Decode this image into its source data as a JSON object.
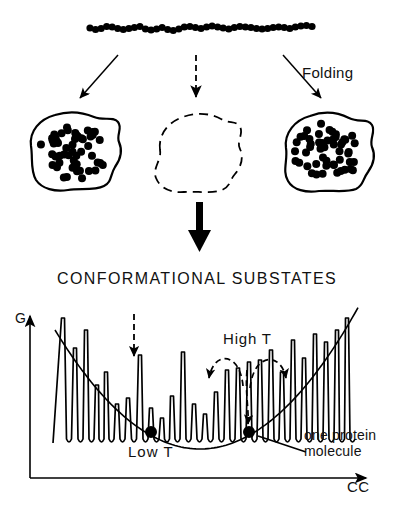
{
  "figure": {
    "background": "#ffffff",
    "ink": "#000000"
  },
  "labels": {
    "folding": "Folding",
    "substates_title": "CONFORMATIONAL  SUBSTATES",
    "g_axis": "G",
    "high_t": "High  T",
    "low_t": "Low  T",
    "one_protein_line1": "one  protein",
    "one_protein_line2": "molecule",
    "cc_axis": "CC"
  },
  "chain": {
    "description": "unfolded polypeptide chain of beads",
    "bead_count": 41,
    "bead_radius": 3.6,
    "x_start": 90,
    "x_end": 312,
    "y_center": 28,
    "wobble": [
      0,
      1.5,
      0.5,
      -1.5,
      -1,
      0.5,
      1.5,
      0.5,
      -0.5,
      -1.5,
      1,
      2,
      1,
      -0.5,
      1.5,
      2.5,
      1,
      -1,
      -1.5,
      -0.5,
      0.5,
      -1,
      -2,
      -1,
      0,
      1,
      -0.5,
      -1.5,
      -1,
      -0.5,
      0.5,
      1,
      0.5,
      -0.5,
      -1,
      -0.5,
      0.5,
      -1,
      -2,
      -2.5,
      -1.5
    ]
  },
  "arrows": {
    "left_fold": {
      "style": "solid",
      "x1": 118,
      "y1": 55,
      "x2": 78,
      "y2": 100
    },
    "center_fold": {
      "style": "dashed",
      "x1": 196,
      "y1": 55,
      "x2": 196,
      "y2": 100
    },
    "right_fold": {
      "style": "solid",
      "x1": 283,
      "y1": 55,
      "x2": 323,
      "y2": 100
    },
    "thick_down": {
      "style": "thick-solid",
      "x1": 200,
      "y1": 202,
      "x2": 200,
      "y2": 248
    },
    "substate_dashed": {
      "style": "dashed",
      "x1": 134,
      "y1": 314,
      "x2": 134,
      "y2": 358
    }
  },
  "blobs": [
    {
      "name": "folded-protein-left",
      "outline": "solid",
      "filled": true,
      "cx": 73,
      "cy": 152,
      "dot_count": 52
    },
    {
      "name": "unfolded-blob-center",
      "outline": "dashed",
      "filled": false,
      "cx": 200,
      "cy": 152,
      "dot_count": 0
    },
    {
      "name": "folded-protein-right",
      "outline": "solid",
      "filled": true,
      "cx": 327,
      "cy": 152,
      "dot_count": 52
    }
  ],
  "chart_data": {
    "type": "line",
    "title": "CONFORMATIONAL  SUBSTATES",
    "xlabel": "CC",
    "ylabel": "G",
    "grid": false,
    "legend": null,
    "axis": {
      "x_origin": 30,
      "y_origin": 478,
      "x_end": 372,
      "y_top": 312
    },
    "envelope": {
      "description": "smooth parabolic low-temperature envelope",
      "vertex_x": 200,
      "vertex_y": 449,
      "left_x": 55,
      "left_y": 330,
      "right_x": 360,
      "right_y": 330
    },
    "peaks_x": [
      63,
      75,
      86,
      97,
      106,
      117,
      128,
      140,
      151,
      162,
      172,
      183,
      194,
      205,
      216,
      227,
      238,
      249,
      260,
      271,
      282,
      293,
      304,
      315,
      326,
      337,
      347
    ],
    "peaks_y": [
      318,
      348,
      330,
      385,
      372,
      404,
      398,
      355,
      408,
      418,
      396,
      352,
      404,
      414,
      392,
      370,
      368,
      362,
      360,
      350,
      372,
      340,
      358,
      334,
      342,
      330,
      318
    ],
    "wells_y": 443,
    "molecules": [
      {
        "name": "protein-molecule-dot-left",
        "x": 151,
        "y": 432,
        "r": 6
      },
      {
        "name": "protein-molecule-dot-right",
        "x": 249,
        "y": 432,
        "r": 6
      }
    ],
    "hop_arcs": [
      {
        "name": "high-t-hop-left",
        "from_x": 245,
        "to_x": 208,
        "apex_y": 356,
        "base_y": 392
      },
      {
        "name": "high-t-hop-right",
        "from_x": 252,
        "to_x": 288,
        "apex_y": 356,
        "base_y": 392
      }
    ],
    "leader_line": {
      "x1": 262,
      "y1": 436,
      "x2": 306,
      "y2": 452
    }
  }
}
